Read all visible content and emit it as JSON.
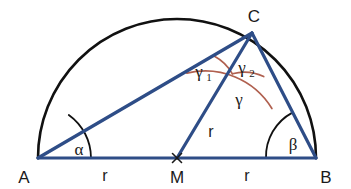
{
  "figure": {
    "background_color": "#ffffff",
    "width": 351,
    "height": 189
  },
  "colors": {
    "segment_blue": "#2e4d87",
    "arc_black": "#111111",
    "angle_arc_red": "#b0604f",
    "text_black": "#1a1a1a"
  },
  "vertices": [
    {
      "name": "A",
      "label": "A",
      "x": 38,
      "y": 158,
      "label_x": 24,
      "label_y": 180
    },
    {
      "name": "B",
      "label": "B",
      "x": 316,
      "y": 158,
      "label_x": 324,
      "label_y": 180
    },
    {
      "name": "C",
      "label": "C",
      "x": 252,
      "y": 33,
      "label_x": 252,
      "label_y": 19
    },
    {
      "name": "M",
      "label": "M",
      "x": 177,
      "y": 158,
      "label_x": 177,
      "label_y": 180
    }
  ],
  "semicircle": {
    "center_x": 177,
    "center_y": 158,
    "radius": 139,
    "stroke_color": "#111111",
    "stroke_width": 2.6
  },
  "segments": [
    {
      "name": "segment-AB",
      "from": "A",
      "to": "B",
      "x1": 38,
      "y1": 158,
      "x2": 316,
      "y2": 158
    },
    {
      "name": "segment-AC",
      "from": "A",
      "to": "C",
      "x1": 38,
      "y1": 158,
      "x2": 252,
      "y2": 33
    },
    {
      "name": "segment-CB",
      "from": "C",
      "to": "B",
      "x1": 252,
      "y1": 33,
      "x2": 316,
      "y2": 158
    },
    {
      "name": "segment-MC",
      "from": "M",
      "to": "C",
      "x1": 177,
      "y1": 158,
      "x2": 252,
      "y2": 33
    }
  ],
  "length_labels": [
    {
      "name": "length-AM",
      "text": "r",
      "x": 105,
      "y": 180,
      "segment": "A-M"
    },
    {
      "name": "length-MB",
      "text": "r",
      "x": 247,
      "y": 180,
      "segment": "M-B"
    },
    {
      "name": "length-MC",
      "text": "r",
      "x": 210,
      "y": 136,
      "segment": "M-C"
    }
  ],
  "angles": [
    {
      "name": "angle-alpha",
      "label": "α",
      "vertex": "A",
      "label_x": 78,
      "label_y": 154,
      "arc_radius": 53,
      "arc_color": "#111111",
      "description": "angle at A between AB and AC"
    },
    {
      "name": "angle-beta",
      "label": "β",
      "vertex": "B",
      "label_x": 292,
      "label_y": 149,
      "arc_radius": 50,
      "arc_color": "#111111",
      "description": "angle at B between BA and BC"
    },
    {
      "name": "angle-gamma1",
      "label": "γ",
      "sublabel": "1",
      "vertex": "C",
      "label_x": 200,
      "label_y": 76,
      "arc_radius": 45,
      "arc_color": "#b0604f",
      "description": "angle at C between CA and CM"
    },
    {
      "name": "angle-gamma2",
      "label": "γ",
      "sublabel": "2",
      "vertex": "C",
      "label_x": 244,
      "label_y": 72,
      "arc_radius": 45,
      "arc_color": "#b0604f",
      "description": "angle at C between CM and CB"
    },
    {
      "name": "angle-gamma",
      "label": "γ",
      "vertex": "C",
      "label_x": 238,
      "label_y": 104,
      "arc_radius": 78,
      "arc_color": "#b0604f",
      "description": "full angle at C between CA and CB"
    }
  ]
}
